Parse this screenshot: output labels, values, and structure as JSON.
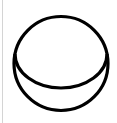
{
  "icon": {
    "name": "circle-with-inner-arc",
    "stroke_color": "#000000",
    "stroke_width": 3.2,
    "background": "#ffffff"
  },
  "divider": {
    "color": "#d4d4d4"
  }
}
